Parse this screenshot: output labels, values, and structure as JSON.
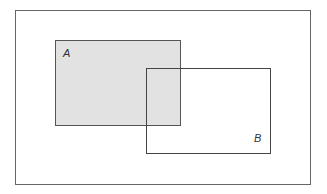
{
  "diagram": {
    "type": "venn-rectangles",
    "universe": {
      "x": 15,
      "y": 10,
      "width": 295,
      "height": 174,
      "stroke": "#666666"
    },
    "sets": [
      {
        "label": "A",
        "x": 55,
        "y": 40,
        "width": 125,
        "height": 85,
        "fill": "#e2e2e2",
        "stroke": "#555555",
        "label_x": 63,
        "label_y": 57,
        "shaded": true
      },
      {
        "label": "B",
        "x": 146,
        "y": 68,
        "width": 124,
        "height": 85,
        "fill": "none",
        "stroke": "#444444",
        "label_x": 254,
        "label_y": 142,
        "shaded": false
      }
    ]
  }
}
